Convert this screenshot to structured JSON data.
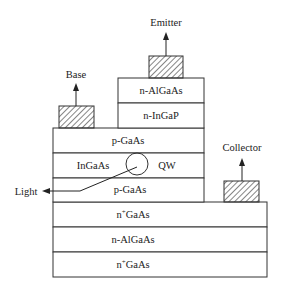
{
  "diagram": {
    "title": "",
    "colors": {
      "stroke": "#333333",
      "text": "#222222",
      "background": "#ffffff"
    },
    "terminals": {
      "emitter": {
        "label": "Emitter"
      },
      "base": {
        "label": "Base"
      },
      "collector": {
        "label": "Collector"
      },
      "light": {
        "label": "Light"
      }
    },
    "emitter_stack": [
      {
        "label": "n-AlGaAs"
      },
      {
        "label": "n-InGaP"
      }
    ],
    "base_stack": [
      {
        "label": "p-GaAs"
      },
      {
        "label": "InGaAs",
        "side_label": "QW"
      },
      {
        "label": "p-GaAs"
      }
    ],
    "collector_stack": [
      {
        "label_main": "n",
        "label_sup": "+",
        "label_rest": "GaAs"
      },
      {
        "label": "n-AlGaAs"
      },
      {
        "label_main": "n",
        "label_sup": "+",
        "label_rest": "GaAs"
      }
    ]
  }
}
